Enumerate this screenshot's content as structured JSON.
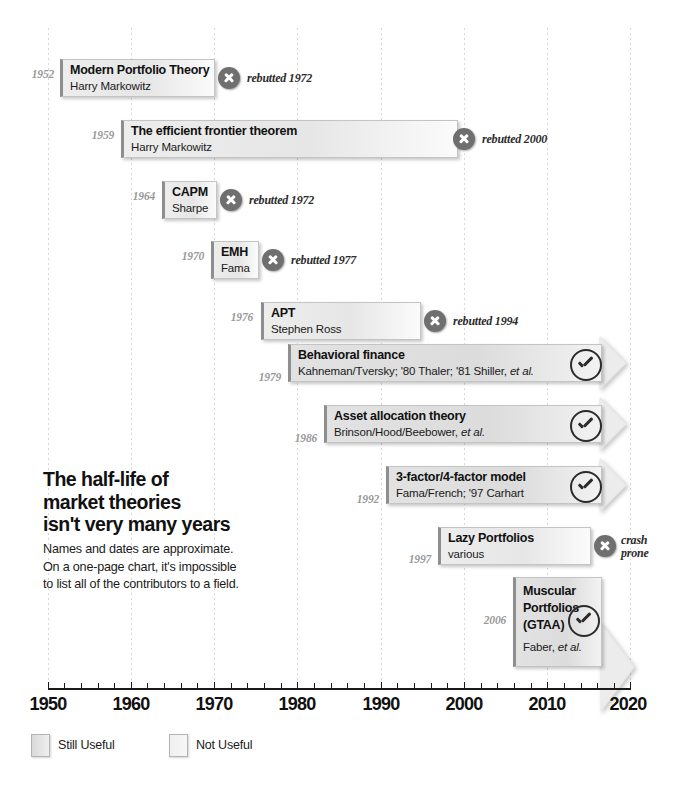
{
  "chart_data": {
    "type": "bar",
    "title": "The half-life of\nmarket theories\nisn't very many years",
    "subtitle": "Names and dates are approximate.\nOn a one-page chart, it's impossible\nto list all of the contributors to a field.",
    "xlabel": "",
    "ylabel": "",
    "xlim": [
      1950,
      2020
    ],
    "x_ticks": [
      "1950",
      "1960",
      "1970",
      "1980",
      "1990",
      "2000",
      "2010",
      "2020"
    ],
    "grid": true,
    "legend_position": "bottom-left",
    "series": [
      {
        "name": "Still Useful",
        "color": "#e2e2e2"
      },
      {
        "name": "Not Useful",
        "color": "#ededed"
      }
    ],
    "items": [
      {
        "year": "1952",
        "start": 1952,
        "end": 1972,
        "name": "Modern Portfolio Theory",
        "authors": "Harry Markowitz",
        "status": "not-useful",
        "status_icon": "x-circle-icon",
        "note": "rebutted 1972"
      },
      {
        "year": "1959",
        "start": 1959,
        "end": 2000,
        "name": "The efficient frontier theorem",
        "authors": "Harry Markowitz",
        "status": "not-useful",
        "status_icon": "x-circle-icon",
        "note": "rebutted 2000"
      },
      {
        "year": "1964",
        "start": 1964,
        "end": 1972,
        "name": "CAPM",
        "authors": "Sharpe",
        "status": "not-useful",
        "status_icon": "x-circle-icon",
        "note": "rebutted 1972"
      },
      {
        "year": "1970",
        "start": 1970,
        "end": 1977,
        "name": "EMH",
        "authors": "Fama",
        "status": "not-useful",
        "status_icon": "x-circle-icon",
        "note": "rebutted 1977"
      },
      {
        "year": "1976",
        "start": 1976,
        "end": 1994,
        "name": "APT",
        "authors": "Stephen Ross",
        "status": "not-useful",
        "status_icon": "x-circle-icon",
        "note": "rebutted 1994"
      },
      {
        "year": "1979",
        "start": 1979,
        "end": 2020,
        "name": "Behavioral finance",
        "authors": "Kahneman/Tversky; '80 Thaler; '81 Shiller, et al.",
        "status": "still-useful",
        "status_icon": "check-circle-icon",
        "note": ""
      },
      {
        "year": "1986",
        "start": 1986,
        "end": 2020,
        "name": "Asset allocation theory",
        "authors": "Brinson/Hood/Beebower, et al.",
        "status": "still-useful",
        "status_icon": "check-circle-icon",
        "note": ""
      },
      {
        "year": "1992",
        "start": 1992,
        "end": 2020,
        "name": "3-factor/4-factor model",
        "authors": "Fama/French; '97 Carhart",
        "status": "still-useful",
        "status_icon": "check-circle-icon",
        "note": ""
      },
      {
        "year": "1997",
        "start": 1997,
        "end": 2018,
        "name": "Lazy Portfolios",
        "authors": "various",
        "status": "not-useful",
        "status_icon": "x-circle-icon",
        "note": "crash\nprone"
      },
      {
        "year": "2006",
        "start": 2006,
        "end": 2020,
        "name": "Muscular Portfolios (GTAA)",
        "name_lines": "Muscular\nPortfolios\n(GTAA)",
        "authors": "Faber, et al.",
        "status": "still-useful",
        "status_icon": "check-circle-icon",
        "note": ""
      }
    ]
  },
  "headline": "The half-life of\nmarket theories\nisn't very many years",
  "subtext": "Names and dates are approximate.\nOn a one-page chart, it's impossible\nto list all of the contributors to a field.",
  "axis": {
    "labels": [
      "1950",
      "1960",
      "1970",
      "1980",
      "1990",
      "2000",
      "2010",
      "2020"
    ]
  },
  "legend": {
    "items": [
      {
        "label": "Still Useful",
        "kind": "useful"
      },
      {
        "label": "Not Useful",
        "kind": "notuseful"
      }
    ]
  }
}
